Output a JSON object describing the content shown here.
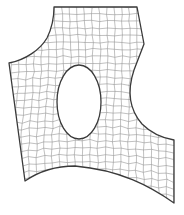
{
  "diagram": {
    "type": "quadrilateral-mesh",
    "canvas": {
      "width": 184,
      "height": 215
    },
    "colors": {
      "background": "#ffffff",
      "boundary": "#3a3a3a",
      "mesh": "#8c8c8c"
    },
    "outer_boundary_path": "M54,7 L137,7 L144,44 L134,70 C128,88 128,108 142,124 C152,134 162,138 174,140 L174,203 C150,186 120,170 75,166 C55,166 38,172 25,181 L9,63 C25,60 40,50 47,38 C52,28 54,17 54,7 Z",
    "hole": {
      "shape": "ellipse",
      "cx": 79,
      "cy": 102,
      "rx": 22,
      "ry": 37
    },
    "grid": {
      "columns": 22,
      "rows": 27,
      "x_range": [
        9,
        174
      ],
      "y_range": [
        7,
        203
      ],
      "jitter": 1.4
    }
  }
}
